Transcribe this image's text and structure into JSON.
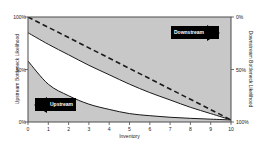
{
  "chart_data": {
    "type": "area",
    "title": "",
    "subtitle": "",
    "xlabel": "Inventory",
    "ylabel": "Upstream Bottleneck Likelihood",
    "y2label": "Downstream Bottleneck Likelihood",
    "xlim": [
      0,
      10
    ],
    "ylim": [
      0,
      100
    ],
    "y2lim": [
      100,
      0
    ],
    "grid": false,
    "legend_position": "none",
    "xticks": [
      "0",
      "1",
      "2",
      "3",
      "4",
      "5",
      "6",
      "7",
      "8",
      "9",
      "10"
    ],
    "xtick_values": [
      0,
      1,
      2,
      3,
      4,
      5,
      6,
      7,
      8,
      9,
      10
    ],
    "yticks_left": [
      "0%",
      "50%",
      "100%"
    ],
    "ytick_left_values": [
      0,
      50,
      100
    ],
    "yticks_right": [
      "0%",
      "50%",
      "100%"
    ],
    "ytick_right_values": [
      0,
      50,
      100
    ],
    "x": [
      0,
      1,
      2,
      3,
      4,
      5,
      6,
      7,
      8,
      9,
      10
    ],
    "series": [
      {
        "name": "Upper bound curve",
        "style": "solid",
        "color": "#1a1a1a",
        "values": [
          85,
          74,
          64,
          54,
          45,
          36,
          28,
          21,
          14,
          8,
          2
        ]
      },
      {
        "name": "Lower bound curve",
        "style": "solid",
        "color": "#1a1a1a",
        "values": [
          58,
          36,
          25,
          17,
          12,
          8,
          6,
          4.5,
          3.5,
          2.7,
          2
        ]
      },
      {
        "name": "Reference diagonal",
        "style": "dashed",
        "color": "#1a1a1a",
        "values": [
          100,
          90.2,
          80.4,
          70.6,
          60.8,
          51,
          41.2,
          31.4,
          21.6,
          11.8,
          2
        ]
      }
    ],
    "shaded_regions": [
      {
        "name": "upper-gray-region",
        "color": "#c8c8c8",
        "between": [
          "Upper bound curve",
          "100"
        ]
      },
      {
        "name": "white-wedge",
        "color": "#ffffff",
        "between": [
          "Upper bound curve",
          "Lower bound curve"
        ]
      },
      {
        "name": "lower-gray-region",
        "color": "#c8c8c8",
        "between": [
          "Lower bound curve",
          "0"
        ]
      }
    ],
    "annotations": [
      {
        "name": "downstream",
        "text": "Downstream",
        "arrow": "right"
      },
      {
        "name": "upstream",
        "text": "Upstream",
        "arrow": "left"
      }
    ]
  }
}
